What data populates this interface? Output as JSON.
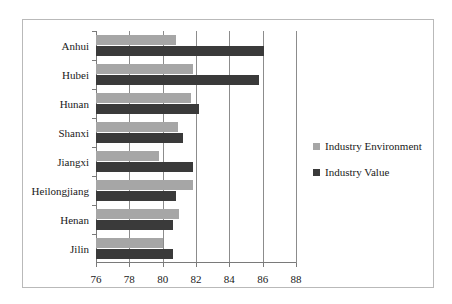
{
  "chart_data": {
    "type": "bar",
    "orientation": "horizontal",
    "title": "",
    "xlabel": "",
    "ylabel": "",
    "categories": [
      "Anhui",
      "Hubei",
      "Hunan",
      "Shanxi",
      "Jiangxi",
      "Heilongjiang",
      "Henan",
      "Jilin"
    ],
    "series": [
      {
        "name": "Industry Environment",
        "color": "#a6a6a6",
        "values": [
          80.8,
          81.8,
          81.7,
          80.9,
          79.8,
          81.8,
          81.0,
          80.0
        ]
      },
      {
        "name": "Industry Value",
        "color": "#3a3a3a",
        "values": [
          86.1,
          85.8,
          82.2,
          81.2,
          81.8,
          80.8,
          80.6,
          80.6
        ]
      }
    ],
    "xlim": [
      76,
      88
    ],
    "xticks": [
      76,
      78,
      80,
      82,
      84,
      86,
      88
    ],
    "xtick_labels": [
      "76",
      "78",
      "80",
      "82",
      "84",
      "86",
      "88"
    ],
    "grid": true,
    "grid_axis": "x",
    "legend_position": "right"
  },
  "legend": {
    "items": [
      {
        "label": "Industry Environment",
        "swatch": "env"
      },
      {
        "label": "Industry Value",
        "swatch": "val"
      }
    ]
  }
}
